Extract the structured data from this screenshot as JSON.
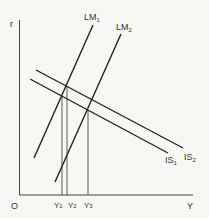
{
  "diagram": {
    "type": "IS-LM",
    "axes": {
      "y_label": "r",
      "x_label": "Y",
      "origin_label": "O"
    },
    "curves": [
      {
        "id": "LM1",
        "name": "LM",
        "sub": "1"
      },
      {
        "id": "LM2",
        "name": "LM",
        "sub": "2"
      },
      {
        "id": "IS1",
        "name": "IS",
        "sub": "1"
      },
      {
        "id": "IS2",
        "name": "IS",
        "sub": "2"
      }
    ],
    "x_ticks": [
      {
        "name": "Y",
        "sub": "1"
      },
      {
        "name": "Y",
        "sub": "2"
      },
      {
        "name": "Y",
        "sub": "3"
      }
    ],
    "colors": {
      "line": "#222222",
      "background": "#f7f7f4"
    }
  }
}
